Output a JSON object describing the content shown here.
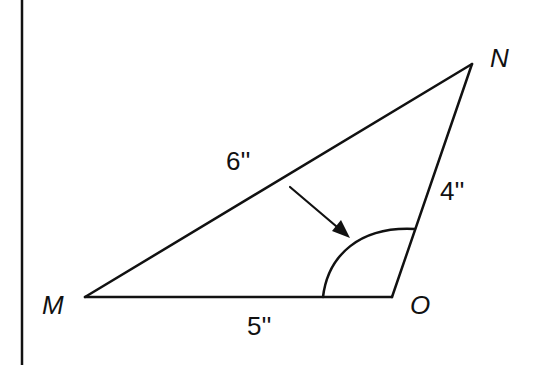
{
  "diagram": {
    "type": "triangle",
    "vertices": {
      "M": {
        "label": "M",
        "x": 85,
        "y": 297
      },
      "N": {
        "label": "N",
        "x": 472,
        "y": 64
      },
      "O": {
        "label": "O",
        "x": 392,
        "y": 297
      }
    },
    "sides": {
      "MN": {
        "label": "6''",
        "length": "6 in"
      },
      "NO": {
        "label": "4''",
        "length": "4 in"
      },
      "MO": {
        "label": "5''",
        "length": "5 in"
      }
    },
    "marked_angle": {
      "vertex": "O",
      "indicator": "arrow-pointing-to-arc"
    },
    "colors": {
      "stroke": "#111111",
      "background": "#ffffff"
    }
  }
}
